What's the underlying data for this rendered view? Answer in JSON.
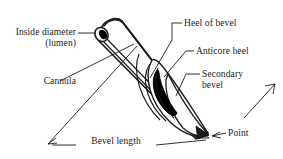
{
  "figure": {
    "background_color": "#ffffff",
    "line_color": "#1a1a1a",
    "fill_dark": "#000000"
  },
  "labels": {
    "inside_diameter_line1": "Inside diameter",
    "inside_diameter_line2": "(lumen)",
    "cannula": "Cannula",
    "heel_of_bevel": "Heel of bevel",
    "anticore_heel": "Anticore heel",
    "secondary_bevel_line1": "Secondary",
    "secondary_bevel_line2": "bevel",
    "point": "Point",
    "bevel_length": "Bevel length"
  }
}
